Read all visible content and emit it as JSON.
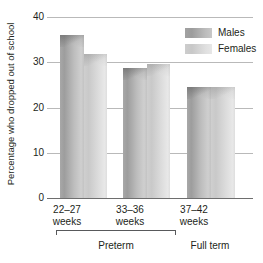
{
  "chart_data": {
    "type": "bar",
    "title": "",
    "xlabel": "",
    "ylabel": "Percentage who dropped out of school",
    "ylim": [
      0,
      40
    ],
    "yticks": [
      0,
      10,
      20,
      30,
      40
    ],
    "ytick_labels": [
      "0",
      "10",
      "20",
      "30",
      "40"
    ],
    "grid": true,
    "legend_position": "top-right",
    "categories": [
      "22–27 weeks",
      "33–36 weeks",
      "37–42 weeks"
    ],
    "category_lines": [
      {
        "line1": "22–27",
        "line2": "weeks"
      },
      {
        "line1": "33–36",
        "line2": "weeks"
      },
      {
        "line1": "37–42",
        "line2": "weeks"
      }
    ],
    "series": [
      {
        "name": "Males",
        "color": "#b0b0b0",
        "values": [
          36.0,
          28.7,
          24.6
        ]
      },
      {
        "name": "Females",
        "color": "#d8d8d8",
        "values": [
          31.8,
          29.6,
          24.6
        ]
      }
    ],
    "groups": [
      {
        "label": "Preterm",
        "categories": [
          "22–27 weeks",
          "33–36 weeks"
        ],
        "bracket": true
      },
      {
        "label": "Full term",
        "categories": [
          "37–42 weeks"
        ],
        "bracket": false
      }
    ]
  },
  "legend": {
    "items": [
      {
        "label": "Males",
        "swatch": "legend-swatch-males"
      },
      {
        "label": "Females",
        "swatch": "legend-swatch-females"
      }
    ]
  },
  "colors": {
    "male_bar": "#b0b0b0",
    "female_bar": "#d8d8d8",
    "gridline": "#b9b9b9",
    "axis": "#6e6e6e",
    "text": "#231f20",
    "background": "#ffffff"
  }
}
